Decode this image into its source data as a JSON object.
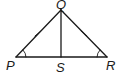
{
  "diagram": {
    "type": "geometry-triangle",
    "colors": {
      "stroke": "#1a1a1a",
      "background": "#ffffff"
    },
    "points": {
      "P": {
        "label": "P",
        "x": 16,
        "y": 57
      },
      "Q": {
        "label": "Q",
        "x": 61,
        "y": 10
      },
      "R": {
        "label": "R",
        "x": 107,
        "y": 57
      },
      "S": {
        "label": "S",
        "x": 61,
        "y": 57
      }
    },
    "segments": [
      {
        "from": "P",
        "to": "Q",
        "marks": 1
      },
      {
        "from": "Q",
        "to": "R",
        "marks": 1
      },
      {
        "from": "P",
        "to": "R",
        "marks": 0
      },
      {
        "from": "Q",
        "to": "S",
        "marks": 0
      }
    ],
    "angle_marks": [
      {
        "vertex": "P",
        "arcs": 1
      },
      {
        "vertex": "R",
        "arcs": 1
      }
    ]
  }
}
